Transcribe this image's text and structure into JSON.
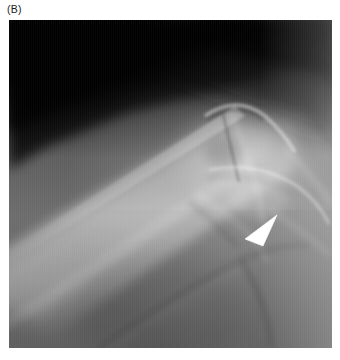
{
  "figure": {
    "panel_label": "(B)",
    "modality": "radiograph",
    "anatomy": "shoulder girdle — clavicle and acromioclavicular / glenohumeral region",
    "orientation": "oblique anteroposterior projection",
    "background_color": "#ffffff",
    "image": {
      "x": 9,
      "y": 20,
      "width": 323,
      "height": 328,
      "tone_range_hex": [
        "#050505",
        "#e8e8e8"
      ],
      "base_tone_hex": "#6d6d6d"
    },
    "marker": {
      "name": "arrowhead-marker",
      "shape": "solid triangle",
      "color_hex": "#ffffff",
      "points_toward": "down-left",
      "center_x": 261,
      "center_y": 215,
      "width": 30,
      "height": 22,
      "indicates": "region of interest at the inferior joint margin"
    },
    "regions": [
      {
        "name": "upper-left-background",
        "tone_hex": "#080808",
        "description": "radiolucent air / off-field dark corner"
      },
      {
        "name": "clavicle-shaft",
        "tone_hex": "#b4b4b4",
        "description": "bright diagonal bone shaft running lower-left to upper-right"
      },
      {
        "name": "soft-tissue-field",
        "tone_hex": "#6f6f6f",
        "description": "uniform mid-gray soft tissue"
      },
      {
        "name": "joint-complex",
        "tone_hex": "#9c9c9c",
        "description": "overlapping cortical lines of the acromion, coracoid and glenoid"
      },
      {
        "name": "upper-right-gradient",
        "tone_hex": "#3a3a3a",
        "description": "dark-to-light diagonal gradient at the superior right field"
      },
      {
        "name": "inferior-curved-margin",
        "tone_hex": "#5d5d5d",
        "description": "curved soft-tissue / bone edge crossing the lower field"
      }
    ]
  }
}
